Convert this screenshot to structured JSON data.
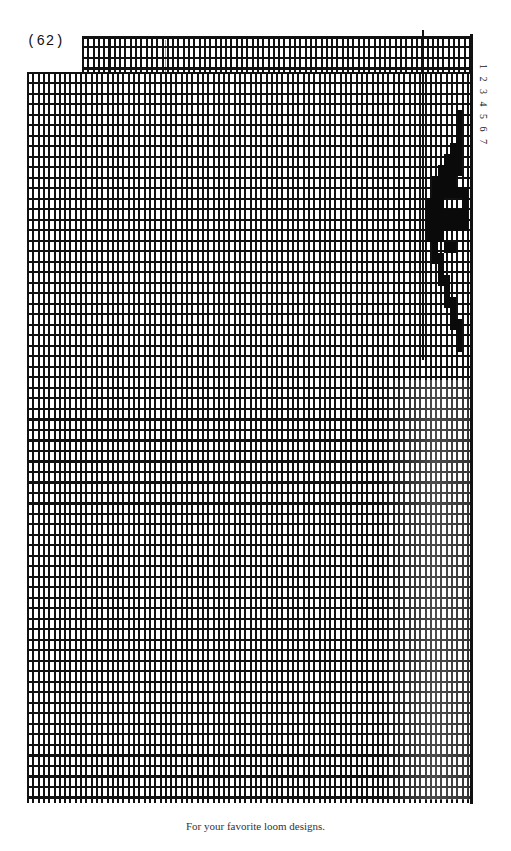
{
  "page": {
    "page_number": "(62)",
    "caption": "For your favorite loom designs.",
    "treadle_numbers": "1 2 3 4 5 6 7"
  },
  "draft": {
    "grid_type": "graph paper",
    "ink_color": "#111111",
    "paper_color": "#ffffff",
    "motif_cells": [
      [
        456,
        110
      ],
      [
        456,
        121
      ],
      [
        456,
        132
      ],
      [
        456,
        143
      ],
      [
        450,
        143
      ],
      [
        450,
        154
      ],
      [
        450,
        165
      ],
      [
        444,
        165
      ],
      [
        444,
        176
      ],
      [
        438,
        176
      ],
      [
        438,
        187
      ],
      [
        432,
        187
      ],
      [
        432,
        198
      ],
      [
        426,
        198
      ],
      [
        426,
        209
      ],
      [
        426,
        220
      ],
      [
        426,
        231
      ],
      [
        432,
        176
      ],
      [
        438,
        198
      ],
      [
        444,
        187
      ],
      [
        450,
        187
      ],
      [
        456,
        187
      ],
      [
        462,
        187
      ],
      [
        462,
        198
      ],
      [
        462,
        209
      ],
      [
        456,
        209
      ],
      [
        450,
        209
      ],
      [
        444,
        209
      ],
      [
        438,
        209
      ],
      [
        432,
        209
      ],
      [
        432,
        220
      ],
      [
        438,
        220
      ],
      [
        444,
        220
      ],
      [
        450,
        220
      ],
      [
        456,
        220
      ],
      [
        432,
        231
      ],
      [
        438,
        231
      ],
      [
        432,
        242
      ],
      [
        432,
        253
      ],
      [
        438,
        253
      ],
      [
        438,
        264
      ],
      [
        438,
        275
      ],
      [
        444,
        275
      ],
      [
        444,
        286
      ],
      [
        444,
        297
      ],
      [
        450,
        297
      ],
      [
        450,
        308
      ],
      [
        450,
        319
      ],
      [
        456,
        319
      ],
      [
        456,
        330
      ],
      [
        456,
        341
      ],
      [
        444,
        154
      ],
      [
        438,
        165
      ],
      [
        450,
        176
      ],
      [
        456,
        154
      ],
      [
        456,
        165
      ],
      [
        462,
        220
      ],
      [
        444,
        242
      ],
      [
        450,
        242
      ]
    ]
  }
}
